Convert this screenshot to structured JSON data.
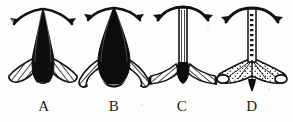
{
  "plate": {
    "title": "Comparative specimen plate",
    "background_color": "#fdfdfc",
    "ink_color": "#111111",
    "width": 293,
    "height": 122,
    "caption_font_style": "serif"
  },
  "figures": [
    {
      "id": "figure-a",
      "label": "A",
      "label_x": 24,
      "x": 4,
      "width": 78,
      "body_shape": "narrow-tapered-cone",
      "body_fill": "solid-black",
      "horns": "paired-curved-downturned-arrows",
      "base": "two-hatched-lateral-wings",
      "base_texture": "cross-hatched"
    },
    {
      "id": "figure-b",
      "label": "B",
      "label_x": 94,
      "x": 74,
      "width": 80,
      "body_shape": "broad-bulbous-cone",
      "body_fill": "solid-black",
      "horns": "paired-curved-downturned-arrows",
      "base": "two-long-hooked-hatched-wings",
      "base_texture": "cross-hatched"
    },
    {
      "id": "figure-c",
      "label": "C",
      "label_x": 162,
      "x": 146,
      "width": 74,
      "body_shape": "slender-straight-stem",
      "body_fill": "striped-outline",
      "horns": "single-arched-bar-with-arrow-tips",
      "base": "wide-flat-hatched-flange",
      "base_texture": "cross-hatched"
    },
    {
      "id": "figure-d",
      "label": "D",
      "label_x": 232,
      "x": 214,
      "width": 76,
      "body_shape": "slender-beaded-stem",
      "body_fill": "dotted-outline",
      "horns": "single-arched-bar-with-arrow-tips",
      "base": "broad-webbed-fan-with-rolled-ends",
      "base_texture": "fine-stipple-web"
    }
  ],
  "artifacts": [
    {
      "x": 11,
      "y": 19,
      "size": 3
    },
    {
      "x": 7,
      "y": 23,
      "size": 2
    },
    {
      "x": 207,
      "y": 26,
      "size": 2
    },
    {
      "x": 268,
      "y": 88,
      "size": 2
    },
    {
      "x": 141,
      "y": 104,
      "size": 2
    }
  ]
}
